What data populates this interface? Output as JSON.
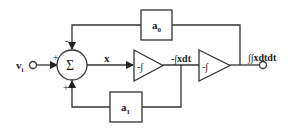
{
  "diagram": {
    "type": "block-diagram",
    "title": "",
    "input": {
      "label": "v",
      "subscript": "i"
    },
    "summer": {
      "symbol": "Σ",
      "signs": {
        "top": "-",
        "left": "+",
        "bottom": "+"
      }
    },
    "signals": {
      "x": "x",
      "int1_out": "-∫xdt",
      "output": "∫∫xdtdt"
    },
    "integrators": [
      {
        "label": "-∫"
      },
      {
        "label": "-∫"
      }
    ],
    "gains": [
      {
        "label": "a",
        "subscript": "0"
      },
      {
        "label": "a",
        "subscript": "1"
      }
    ],
    "colors": {
      "line": "#333333",
      "background": "#ffffff"
    }
  }
}
